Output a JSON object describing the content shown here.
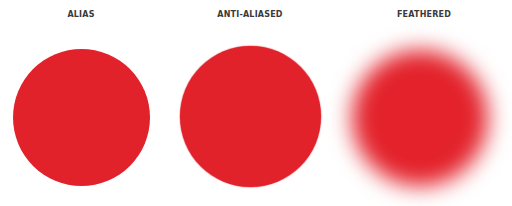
{
  "panels": [
    {
      "label": "ALIAS",
      "color": "#e2222b"
    },
    {
      "label": "ANTI-ALIASED",
      "color": "#e2222b"
    },
    {
      "label": "FEATHERED",
      "color": "#e3222b"
    }
  ]
}
